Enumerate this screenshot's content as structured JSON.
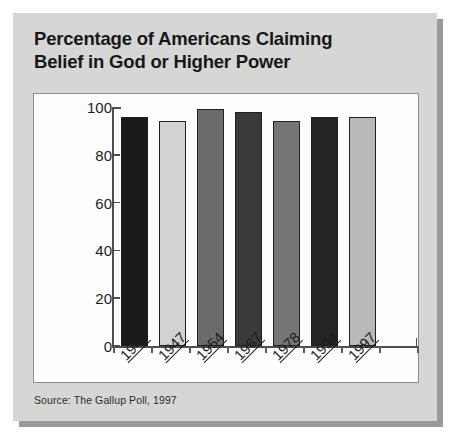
{
  "figure": {
    "title_line1": "Percentage of Americans Claiming",
    "title_line2": "Belief in God or Higher Power",
    "source_note": "Source: The Gallup Poll, 1997",
    "card_color": "#d6d6d4",
    "panel_color": "#fdfdfd",
    "panel_border_color": "#8e8e8e",
    "axis_color": "#4e4e4e",
    "text_color": "#17181a"
  },
  "chart_data": {
    "type": "bar",
    "title": "Percentage of Americans Claiming Belief in God or Higher Power",
    "subtitle": "",
    "xlabel": "",
    "ylabel": "",
    "categories": [
      "1944",
      "1947",
      "1954",
      "1967",
      "1978",
      "1994",
      "1997"
    ],
    "values": [
      96,
      94,
      99,
      98,
      94,
      96,
      96
    ],
    "ylim": [
      0,
      100
    ],
    "yticks": [
      0,
      20,
      40,
      60,
      80,
      100
    ],
    "ytick_labels": [
      "0",
      "20",
      "40",
      "60",
      "80",
      "100"
    ],
    "grid": false,
    "legend": "none",
    "bar_colors": [
      "#1a1a1a",
      "#d2d2d2",
      "#6b6b6b",
      "#3a3a3a",
      "#767676",
      "#242424",
      "#b9b9b9"
    ],
    "bar_edge_color": "#202020",
    "source": "The Gallup Poll, 1997"
  }
}
